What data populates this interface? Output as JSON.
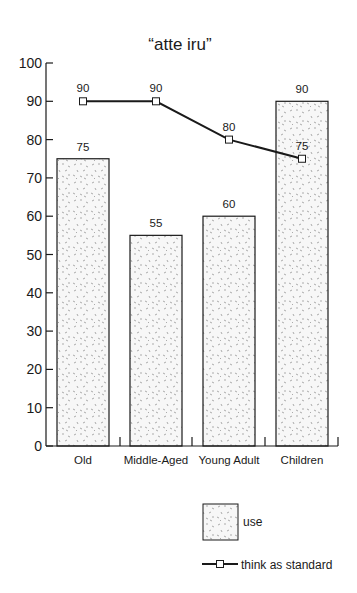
{
  "chart_data": {
    "type": "bar",
    "title": "“atte iru”",
    "xlabel": "",
    "ylabel": "",
    "ylim": [
      0,
      100
    ],
    "yticks": [
      0,
      10,
      20,
      30,
      40,
      50,
      60,
      70,
      80,
      90,
      100
    ],
    "grid": false,
    "legend_position": "bottom-right",
    "categories": [
      "Old",
      "Middle-Aged",
      "Young Adult",
      "Children"
    ],
    "series": [
      {
        "name": "use",
        "type": "bar",
        "values": [
          75,
          55,
          60,
          90
        ]
      },
      {
        "name": "think as standard",
        "type": "line",
        "values": [
          90,
          90,
          80,
          75
        ]
      }
    ]
  },
  "legend": {
    "bar_label": "use",
    "line_label": "think as standard"
  },
  "colors": {
    "bar_fill": "#f4f4f4",
    "stroke": "#1a1a1a",
    "speckle": "#8a8a8a"
  }
}
